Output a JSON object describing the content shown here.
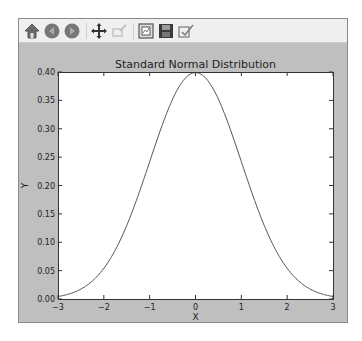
{
  "toolbar": {
    "buttons": [
      {
        "name": "home",
        "icon": "home-icon",
        "enabled": true
      },
      {
        "name": "back",
        "icon": "back-arrow-icon",
        "enabled": true
      },
      {
        "name": "forward",
        "icon": "forward-arrow-icon",
        "enabled": true
      },
      {
        "name": "pan",
        "icon": "move-icon",
        "enabled": true
      },
      {
        "name": "zoom",
        "icon": "zoom-rect-icon",
        "enabled": false
      },
      {
        "name": "subplots",
        "icon": "configure-subplots-icon",
        "enabled": true
      },
      {
        "name": "save",
        "icon": "save-icon",
        "enabled": true
      },
      {
        "name": "customize",
        "icon": "edit-axes-icon",
        "enabled": true
      }
    ]
  },
  "chart_data": {
    "type": "line",
    "title": "Standard Normal Distribution",
    "xlabel": "X",
    "ylabel": "Y",
    "xlim": [
      -3,
      3
    ],
    "ylim": [
      0.0,
      0.4
    ],
    "xticks": [
      -3,
      -2,
      -1,
      0,
      1,
      2,
      3
    ],
    "xtick_labels": [
      "−3",
      "−2",
      "−1",
      "0",
      "1",
      "2",
      "3"
    ],
    "yticks": [
      0.0,
      0.05,
      0.1,
      0.15,
      0.2,
      0.25,
      0.3,
      0.35,
      0.4
    ],
    "ytick_labels": [
      "0.00",
      "0.05",
      "0.10",
      "0.15",
      "0.20",
      "0.25",
      "0.30",
      "0.35",
      "0.40"
    ],
    "grid": false,
    "series": [
      {
        "name": "pdf",
        "color": "#555555",
        "function": "standard normal pdf",
        "x": [
          -3.0,
          -2.5,
          -2.0,
          -1.5,
          -1.0,
          -0.5,
          0.0,
          0.5,
          1.0,
          1.5,
          2.0,
          2.5,
          3.0
        ],
        "y": [
          0.0044,
          0.0175,
          0.054,
          0.1295,
          0.242,
          0.3521,
          0.3989,
          0.3521,
          0.242,
          0.1295,
          0.054,
          0.0175,
          0.0044
        ]
      }
    ]
  },
  "colors": {
    "figure_bg": "#bfbfbf",
    "axes_bg": "#ffffff",
    "toolbar_bg": "#efefef"
  }
}
